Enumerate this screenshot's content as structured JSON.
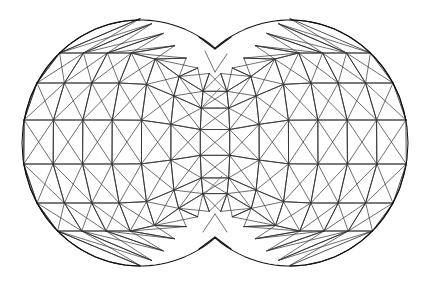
{
  "figure": {
    "render_style": "wireframe",
    "background_color": "#ffffff",
    "line_color": "#2b2b2b",
    "silhouette_color": "#111111",
    "canvas": {
      "width": 432,
      "height": 284
    }
  },
  "chart_data": {
    "type": "mesh",
    "xlabel": "",
    "ylabel": "",
    "xlim": [
      0,
      432
    ],
    "ylim": [
      0,
      284
    ],
    "grid": false,
    "legend": "none",
    "geometry": {
      "shape": "two-merged-spheres",
      "lobes": [
        {
          "name": "left-lobe",
          "center_x": 140,
          "center_y": 143,
          "radius_x": 118,
          "radius_y": 123
        },
        {
          "name": "right-lobe",
          "center_x": 290,
          "center_y": 143,
          "radius_x": 118,
          "radius_y": 123
        }
      ],
      "notch_top": {
        "x": 215,
        "y": 49
      },
      "notch_bottom": {
        "x": 215,
        "y": 237
      },
      "notch_inner_top": {
        "x": 215,
        "y": 72
      },
      "notch_inner_bottom": {
        "x": 215,
        "y": 214
      },
      "bounds": {
        "left": 24,
        "right": 406,
        "top": 18,
        "bottom": 266
      },
      "latitude_rows_y": [
        18,
        53,
        83,
        120,
        164,
        203,
        231,
        266
      ],
      "meridian_columns_x": [
        24,
        31,
        53,
        83,
        120,
        160,
        198,
        215,
        230,
        267,
        305,
        345,
        377,
        398,
        406
      ],
      "segments_long": 26,
      "segments_lat": 7,
      "diagonal_direction": "lower-left-to-upper-right"
    },
    "strays": [
      {
        "name": "upper-centre-stray",
        "x1": 203,
        "y1": 106,
        "x2": 220,
        "y2": 88
      },
      {
        "name": "lower-centre-stray",
        "x1": 203,
        "y1": 196,
        "x2": 222,
        "y2": 176
      }
    ]
  }
}
